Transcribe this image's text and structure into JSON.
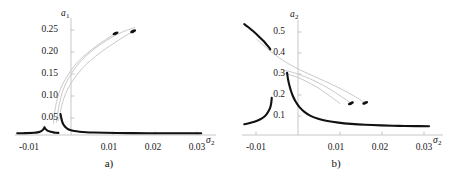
{
  "figure": {
    "background": "#ffffff",
    "stable_color": "#111111",
    "unstable_color": "#c9c9c9",
    "axis_color": "#b9b9b9"
  },
  "panels": [
    {
      "id": "a",
      "caption": "a)",
      "ylabel": "a",
      "ylabel_sub": "1",
      "xlabel": "σ",
      "xlabel_sub": "2",
      "yticks": [
        "0.25",
        "0.20",
        "0.15",
        "0.10",
        "0.05"
      ],
      "ytick_values": [
        0.25,
        0.2,
        0.15,
        0.1,
        0.05
      ],
      "xticks": [
        "-0.01",
        "0.01",
        "0.02",
        "0.03"
      ],
      "xtick_values": [
        -0.01,
        0.01,
        0.02,
        0.03
      ]
    },
    {
      "id": "b",
      "caption": "b)",
      "ylabel": "a",
      "ylabel_sub": "2",
      "xlabel": "σ",
      "xlabel_sub": "2",
      "yticks": [
        "0.5",
        "0.4",
        "0.3",
        "0.2",
        "0.1"
      ],
      "ytick_values": [
        0.5,
        0.4,
        0.3,
        0.2,
        0.1
      ],
      "xticks": [
        "-0.01",
        "0.01",
        "0.02",
        "0.03"
      ],
      "xtick_values": [
        -0.01,
        0.01,
        0.02,
        0.03
      ]
    }
  ],
  "chart_data": [
    {
      "type": "line",
      "title": "a)",
      "xlabel": "σ₂",
      "ylabel": "a₁",
      "xlim": [
        -0.013,
        0.032
      ],
      "ylim": [
        0.0,
        0.275
      ],
      "grid": false,
      "legend": "none",
      "series": [
        {
          "name": "stable-lower-left-branch",
          "style": "thick-black",
          "color": "#111111",
          "points": [
            [
              -0.0128,
              0.004
            ],
            [
              -0.0115,
              0.0042
            ],
            [
              -0.01,
              0.0046
            ],
            [
              -0.0088,
              0.0052
            ],
            [
              -0.008,
              0.0062
            ],
            [
              -0.0074,
              0.0078
            ],
            [
              -0.007,
              0.0098
            ],
            [
              -0.0067,
              0.0122
            ],
            [
              -0.0065,
              0.0148
            ],
            [
              -0.00635,
              0.0172
            ],
            [
              -0.0063,
              0.0186
            ],
            [
              -0.00628,
              0.0178
            ],
            [
              -0.0062,
              0.0158
            ],
            [
              -0.006,
              0.0135
            ],
            [
              -0.0057,
              0.0112
            ],
            [
              -0.0053,
              0.0092
            ],
            [
              -0.0048,
              0.0075
            ],
            [
              -0.0042,
              0.0062
            ],
            [
              -0.0036,
              0.0054
            ],
            [
              -0.003,
              0.005
            ]
          ]
        },
        {
          "name": "stable-right-branch",
          "style": "thick-black",
          "color": "#111111",
          "points": [
            [
              -0.0025,
              0.05
            ],
            [
              -0.0023,
              0.04
            ],
            [
              -0.0021,
              0.032
            ],
            [
              -0.0018,
              0.025
            ],
            [
              -0.0014,
              0.0195
            ],
            [
              -0.0009,
              0.0152
            ],
            [
              -0.0002,
              0.0118
            ],
            [
              0.0008,
              0.0094
            ],
            [
              0.002,
              0.0078
            ],
            [
              0.0036,
              0.0066
            ],
            [
              0.0055,
              0.0058
            ],
            [
              0.008,
              0.0052
            ],
            [
              0.011,
              0.0048
            ],
            [
              0.0145,
              0.0045
            ],
            [
              0.0185,
              0.0043
            ],
            [
              0.023,
              0.0042
            ],
            [
              0.028,
              0.0041
            ],
            [
              0.031,
              0.004
            ]
          ]
        },
        {
          "name": "unstable-branch-1",
          "style": "thin-gray",
          "color": "#c9c9c9",
          "points": [
            [
              -0.003,
              0.034
            ],
            [
              -0.0026,
              0.052
            ],
            [
              -0.0022,
              0.07
            ],
            [
              -0.0016,
              0.09
            ],
            [
              -0.0008,
              0.109
            ],
            [
              0.0004,
              0.129
            ],
            [
              0.0018,
              0.148
            ],
            [
              0.0036,
              0.168
            ],
            [
              0.0058,
              0.187
            ],
            [
              0.0082,
              0.205
            ],
            [
              0.0106,
              0.221
            ],
            [
              0.0126,
              0.234
            ],
            [
              0.014,
              0.242
            ],
            [
              0.015,
              0.247
            ]
          ]
        },
        {
          "name": "unstable-branch-2",
          "style": "thin-gray",
          "color": "#c9c9c9",
          "points": [
            [
              -0.0035,
              0.03
            ],
            [
              -0.0032,
              0.048
            ],
            [
              -0.0029,
              0.068
            ],
            [
              -0.0024,
              0.09
            ],
            [
              -0.0017,
              0.112
            ],
            [
              -0.0006,
              0.135
            ],
            [
              0.0008,
              0.157
            ],
            [
              0.0026,
              0.179
            ],
            [
              0.0048,
              0.199
            ],
            [
              0.0072,
              0.217
            ],
            [
              0.0098,
              0.233
            ],
            [
              0.0122,
              0.245
            ],
            [
              0.014,
              0.252
            ],
            [
              0.0152,
              0.256
            ]
          ]
        },
        {
          "name": "unstable-branch-3",
          "style": "thin-gray",
          "color": "#c9c9c9",
          "points": [
            [
              -0.0042,
              0.028
            ],
            [
              -0.004,
              0.046
            ],
            [
              -0.0037,
              0.066
            ],
            [
              -0.0032,
              0.088
            ],
            [
              -0.0025,
              0.11
            ],
            [
              -0.0014,
              0.132
            ],
            [
              0.0,
              0.154
            ],
            [
              0.0018,
              0.176
            ],
            [
              0.004,
              0.196
            ],
            [
              0.0062,
              0.213
            ],
            [
              0.0082,
              0.227
            ],
            [
              0.0098,
              0.237
            ],
            [
              0.0108,
              0.243
            ]
          ]
        },
        {
          "name": "endpoint-marker-1",
          "style": "marker",
          "color": "#111111",
          "points": [
            [
              0.0148,
              0.247
            ]
          ]
        },
        {
          "name": "endpoint-marker-2",
          "style": "marker",
          "color": "#111111",
          "points": [
            [
              0.0106,
              0.242
            ]
          ]
        }
      ]
    },
    {
      "type": "line",
      "title": "b)",
      "xlabel": "σ₂",
      "ylabel": "a₂",
      "xlim": [
        -0.013,
        0.032
      ],
      "ylim": [
        0.0,
        0.56
      ],
      "grid": false,
      "legend": "none",
      "series": [
        {
          "name": "stable-upper-left-branch",
          "style": "thick-black",
          "color": "#111111",
          "points": [
            [
              -0.0128,
              0.538
            ],
            [
              -0.0118,
              0.523
            ],
            [
              -0.0108,
              0.506
            ],
            [
              -0.0098,
              0.488
            ],
            [
              -0.009,
              0.472
            ],
            [
              -0.0082,
              0.456
            ],
            [
              -0.0076,
              0.442
            ],
            [
              -0.007,
              0.428
            ],
            [
              -0.0066,
              0.416
            ]
          ]
        },
        {
          "name": "stable-lower-left-branch",
          "style": "thick-black",
          "color": "#111111",
          "points": [
            [
              -0.0128,
              0.052
            ],
            [
              -0.0115,
              0.058
            ],
            [
              -0.0102,
              0.065
            ],
            [
              -0.0092,
              0.074
            ],
            [
              -0.0082,
              0.086
            ],
            [
              -0.0075,
              0.1
            ],
            [
              -0.007,
              0.116
            ],
            [
              -0.0066,
              0.134
            ],
            [
              -0.0064,
              0.152
            ],
            [
              -0.0063,
              0.168
            ],
            [
              -0.00625,
              0.18
            ]
          ]
        },
        {
          "name": "stable-right-branch",
          "style": "thick-black",
          "color": "#111111",
          "points": [
            [
              -0.0026,
              0.302
            ],
            [
              -0.0024,
              0.274
            ],
            [
              -0.0021,
              0.245
            ],
            [
              -0.0017,
              0.216
            ],
            [
              -0.0012,
              0.188
            ],
            [
              -0.0005,
              0.16
            ],
            [
              0.0004,
              0.134
            ],
            [
              0.0016,
              0.111
            ],
            [
              0.003,
              0.093
            ],
            [
              0.0048,
              0.079
            ],
            [
              0.007,
              0.068
            ],
            [
              0.0096,
              0.06
            ],
            [
              0.0126,
              0.054
            ],
            [
              0.016,
              0.0495
            ],
            [
              0.0198,
              0.0465
            ],
            [
              0.024,
              0.0445
            ],
            [
              0.0282,
              0.043
            ],
            [
              0.0312,
              0.0422
            ]
          ]
        },
        {
          "name": "unstable-branch-1",
          "style": "thin-gray",
          "color": "#c9c9c9",
          "points": [
            [
              -0.0098,
              0.464
            ],
            [
              -0.0086,
              0.442
            ],
            [
              -0.0072,
              0.418
            ],
            [
              -0.0058,
              0.395
            ],
            [
              -0.0044,
              0.374
            ],
            [
              -0.003,
              0.355
            ],
            [
              -0.0014,
              0.336
            ],
            [
              0.0004,
              0.317
            ],
            [
              0.0026,
              0.296
            ],
            [
              0.005,
              0.274
            ],
            [
              0.0076,
              0.25
            ],
            [
              0.0102,
              0.224
            ],
            [
              0.0126,
              0.198
            ],
            [
              0.0146,
              0.174
            ],
            [
              0.0158,
              0.158
            ]
          ]
        },
        {
          "name": "unstable-branch-2",
          "style": "thin-gray",
          "color": "#c9c9c9",
          "points": [
            [
              -0.004,
              0.318
            ],
            [
              -0.003,
              0.313
            ],
            [
              -0.0016,
              0.306
            ],
            [
              0.0,
              0.296
            ],
            [
              0.0018,
              0.282
            ],
            [
              0.0038,
              0.264
            ],
            [
              0.0058,
              0.243
            ],
            [
              0.0078,
              0.22
            ],
            [
              0.0096,
              0.196
            ],
            [
              0.0112,
              0.174
            ],
            [
              0.0124,
              0.157
            ]
          ]
        },
        {
          "name": "unstable-branch-3",
          "style": "thin-gray",
          "color": "#c9c9c9",
          "points": [
            [
              -0.0044,
              0.306
            ],
            [
              -0.0034,
              0.301
            ],
            [
              -0.002,
              0.293
            ],
            [
              -0.0004,
              0.282
            ],
            [
              0.0014,
              0.266
            ],
            [
              0.0032,
              0.247
            ],
            [
              0.005,
              0.226
            ],
            [
              0.0066,
              0.204
            ],
            [
              0.008,
              0.183
            ],
            [
              0.0092,
              0.165
            ],
            [
              0.01,
              0.152
            ]
          ]
        },
        {
          "name": "endpoint-marker-1",
          "style": "marker",
          "color": "#111111",
          "points": [
            [
              0.016,
              0.156
            ]
          ]
        },
        {
          "name": "endpoint-marker-2",
          "style": "marker",
          "color": "#111111",
          "points": [
            [
              0.0126,
              0.154
            ]
          ]
        }
      ]
    }
  ]
}
